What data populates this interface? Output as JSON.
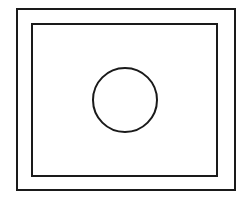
{
  "diagram": {
    "canvas": {
      "width": 248,
      "height": 201,
      "background": "#ffffff"
    },
    "stroke_color": "#1a1a1a",
    "shapes": [
      {
        "type": "rect",
        "name": "outer-frame",
        "x": 17,
        "y": 9,
        "width": 218,
        "height": 181
      },
      {
        "type": "rect",
        "name": "inner-frame",
        "x": 32,
        "y": 24,
        "width": 185,
        "height": 152
      },
      {
        "type": "circle",
        "name": "center-circle",
        "cx": 125,
        "cy": 100,
        "r": 32
      }
    ]
  }
}
